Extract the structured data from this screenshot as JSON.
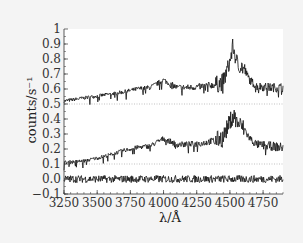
{
  "chart_data": {
    "type": "line",
    "title": "",
    "xlabel": "λ/Å",
    "ylabel": "counts/s⁻¹",
    "xlim": [
      3250,
      4900
    ],
    "ylim": [
      -0.1,
      1.0
    ],
    "x_ticks": [
      "3250",
      "3500",
      "3750",
      "4000",
      "4250",
      "4500",
      "4750"
    ],
    "y_ticks": [
      "−0.1",
      "0.0",
      "0.1",
      "0.2",
      "0.3",
      "0.4",
      "0.5",
      "0.6",
      "0.7",
      "0.8",
      "0.9",
      "1"
    ],
    "grid": false,
    "legend": null,
    "reference_lines": [
      0.5,
      0.1
    ],
    "series": [
      {
        "name": "upper spectrum (offset +0.5)",
        "x": [
          3250,
          3400,
          3550,
          3700,
          3800,
          3900,
          4000,
          4100,
          4200,
          4300,
          4400,
          4450,
          4500,
          4525,
          4550,
          4600,
          4650,
          4700,
          4800,
          4900
        ],
        "values": [
          0.52,
          0.54,
          0.56,
          0.58,
          0.6,
          0.61,
          0.66,
          0.61,
          0.61,
          0.62,
          0.63,
          0.65,
          0.78,
          0.89,
          0.78,
          0.74,
          0.66,
          0.62,
          0.61,
          0.61
        ]
      },
      {
        "name": "middle spectrum (offset +0.1)",
        "x": [
          3250,
          3400,
          3550,
          3700,
          3800,
          3900,
          4000,
          4100,
          4200,
          4300,
          4400,
          4450,
          4500,
          4525,
          4550,
          4600,
          4650,
          4700,
          4800,
          4900
        ],
        "values": [
          0.11,
          0.12,
          0.15,
          0.19,
          0.21,
          0.22,
          0.27,
          0.23,
          0.23,
          0.24,
          0.26,
          0.28,
          0.38,
          0.44,
          0.38,
          0.34,
          0.27,
          0.23,
          0.22,
          0.21
        ]
      },
      {
        "name": "residual",
        "x": [
          3250,
          3500,
          3750,
          4000,
          4250,
          4500,
          4750,
          4900
        ],
        "values": [
          0.0,
          0.0,
          0.0,
          0.0,
          0.0,
          0.0,
          0.0,
          0.0
        ]
      }
    ]
  }
}
